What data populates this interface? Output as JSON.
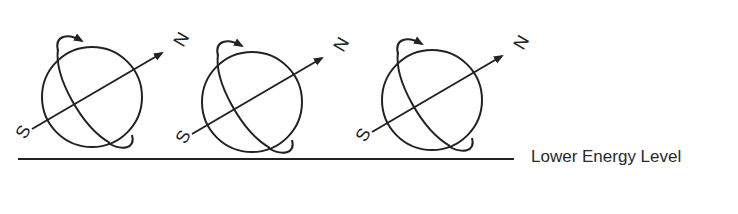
{
  "diagram": {
    "title": "",
    "spheres": [
      {
        "id": "sphere-1",
        "north_label": "N",
        "south_label": "S"
      },
      {
        "id": "sphere-2",
        "north_label": "N",
        "south_label": "S"
      },
      {
        "id": "sphere-3",
        "north_label": "N",
        "south_label": "S"
      }
    ],
    "energy_level_label": "Lower Energy Level",
    "colors": {
      "ink": "#222222",
      "background": "#ffffff"
    }
  }
}
